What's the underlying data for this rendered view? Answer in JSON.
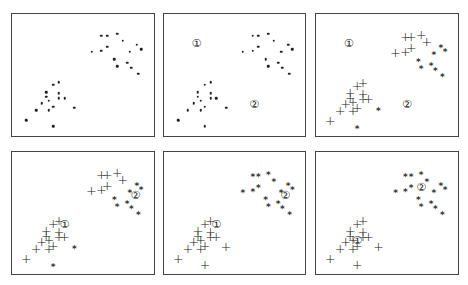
{
  "figure": {
    "centroid_labels": [
      "①",
      "②"
    ],
    "markers": {
      "unassigned": "dot",
      "cluster1": "+",
      "cluster2": "*"
    }
  },
  "points": [
    [
      63,
      18
    ],
    [
      67,
      18
    ],
    [
      74,
      16
    ],
    [
      78,
      22
    ],
    [
      56,
      31
    ],
    [
      63,
      30
    ],
    [
      67,
      27
    ],
    [
      88,
      25
    ],
    [
      83,
      31
    ],
    [
      91,
      29
    ],
    [
      72,
      37
    ],
    [
      74,
      43
    ],
    [
      81,
      40
    ],
    [
      84,
      44
    ],
    [
      89,
      49
    ],
    [
      29,
      58
    ],
    [
      33,
      56
    ],
    [
      24,
      64
    ],
    [
      24,
      68
    ],
    [
      26,
      71
    ],
    [
      33,
      65
    ],
    [
      37,
      69
    ],
    [
      33,
      69
    ],
    [
      21,
      73
    ],
    [
      29,
      76
    ],
    [
      17,
      79
    ],
    [
      26,
      79
    ],
    [
      44,
      77
    ],
    [
      10,
      87
    ],
    [
      29,
      92
    ]
  ],
  "panels": [
    {
      "id": "p1",
      "left": 11,
      "top": 13,
      "width": 144,
      "height": 124,
      "assign": "none",
      "centroids": []
    },
    {
      "id": "p2",
      "left": 163,
      "top": 13,
      "width": 143,
      "height": 124,
      "assign": "none",
      "centroids": [
        [
          23,
          24
        ],
        [
          64,
          74
        ]
      ]
    },
    {
      "id": "p3",
      "left": 315,
      "top": 13,
      "width": 144,
      "height": 124,
      "assign": [
        1,
        1,
        1,
        1,
        1,
        1,
        1,
        2,
        2,
        2,
        2,
        2,
        2,
        2,
        2,
        1,
        1,
        1,
        1,
        1,
        1,
        1,
        1,
        1,
        1,
        1,
        1,
        2,
        1,
        2
      ],
      "centroids": [
        [
          23,
          24
        ],
        [
          64,
          74
        ]
      ]
    },
    {
      "id": "p4",
      "left": 11,
      "top": 151,
      "width": 144,
      "height": 124,
      "assign": [
        1,
        1,
        1,
        1,
        1,
        1,
        1,
        2,
        2,
        2,
        2,
        2,
        2,
        2,
        2,
        1,
        1,
        1,
        1,
        1,
        1,
        1,
        1,
        1,
        1,
        1,
        1,
        2,
        1,
        2
      ],
      "centroids": [
        [
          37,
          59
        ],
        [
          87,
          35
        ]
      ]
    },
    {
      "id": "p5",
      "left": 163,
      "top": 151,
      "width": 143,
      "height": 124,
      "assign": [
        2,
        2,
        2,
        2,
        2,
        2,
        2,
        2,
        2,
        2,
        2,
        2,
        2,
        2,
        2,
        1,
        1,
        1,
        1,
        1,
        1,
        1,
        1,
        1,
        1,
        1,
        1,
        1,
        1,
        1
      ],
      "centroids": [
        [
          37,
          59
        ],
        [
          86,
          35
        ]
      ]
    },
    {
      "id": "p6",
      "left": 315,
      "top": 151,
      "width": 144,
      "height": 124,
      "assign": [
        2,
        2,
        2,
        2,
        2,
        2,
        2,
        2,
        2,
        2,
        2,
        2,
        2,
        2,
        2,
        1,
        1,
        1,
        1,
        1,
        1,
        1,
        1,
        1,
        1,
        1,
        1,
        1,
        1,
        1
      ],
      "centroids": [
        [
          29,
          72
        ],
        [
          74,
          29
        ]
      ]
    }
  ]
}
